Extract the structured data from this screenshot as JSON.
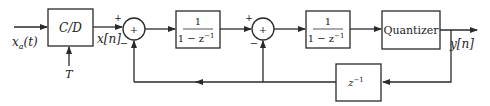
{
  "diagram": {
    "type": "block-diagram",
    "input": {
      "label": "x_a(t)",
      "base": "x",
      "sub": "a",
      "arg": "(t)"
    },
    "sampler": {
      "label": "C/D",
      "control": "T"
    },
    "signals": {
      "x": "x[n]",
      "y": "y[n]"
    },
    "adder1": {
      "symbol": "+",
      "plus": "+",
      "minus": "−"
    },
    "block1": {
      "num": "1",
      "den": "1 − z",
      "den_exp": "−1"
    },
    "adder2": {
      "symbol": "+",
      "plus": "+",
      "minus": "−"
    },
    "block2": {
      "num": "1",
      "den": "1 − z",
      "den_exp": "−1"
    },
    "quantizer": {
      "label": "Quantizer"
    },
    "delay": {
      "base": "z",
      "exp": "−1"
    },
    "colors": {
      "stroke": "#2a2a2a",
      "background": "#ffffff"
    }
  }
}
